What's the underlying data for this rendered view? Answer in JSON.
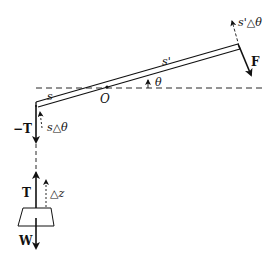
{
  "diagram": {
    "labels": {
      "s": "s",
      "s_prime": "s'",
      "O": "O",
      "theta": "θ",
      "F": "F",
      "neg_T": "−T",
      "s_dtheta": "s△θ",
      "sp_dtheta": "s'△θ",
      "T": "T",
      "dz": "△z",
      "W": "W"
    },
    "colors": {
      "ink": "#111111",
      "background": "#ffffff"
    }
  }
}
